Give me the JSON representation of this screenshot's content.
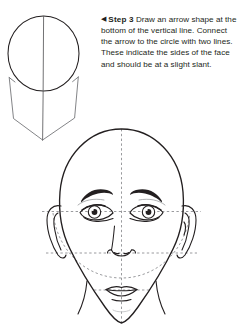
{
  "page": {
    "background_color": "#ffffff",
    "ink_color": "#231f20",
    "guide_color": "#6d6e71",
    "width": 244,
    "height": 333
  },
  "instructions": {
    "marker": "◀",
    "step_label": "Step 3",
    "body": "Draw an arrow shape at the bottom of the vertical line. Connect the arrow to the circle with two lines. These indicate the sides of the face and should be at a slight slant."
  },
  "figures": [
    {
      "name": "step-3-construction-diagram",
      "caption": "",
      "parts": [
        "cranium-circle",
        "vertical-center-line",
        "arrow-left-side-line",
        "arrow-right-side-line",
        "arrow-point"
      ]
    },
    {
      "name": "finished-face-diagram",
      "caption": "",
      "parts": [
        "head-outline",
        "vertical-center-guide",
        "eye-level-guide",
        "nose-level-guide",
        "jaw-arc-guide",
        "left-eye",
        "right-eye",
        "left-eyebrow",
        "right-eyebrow",
        "nose",
        "mouth",
        "left-ear",
        "right-ear",
        "chin",
        "neck-left",
        "neck-right"
      ]
    }
  ]
}
